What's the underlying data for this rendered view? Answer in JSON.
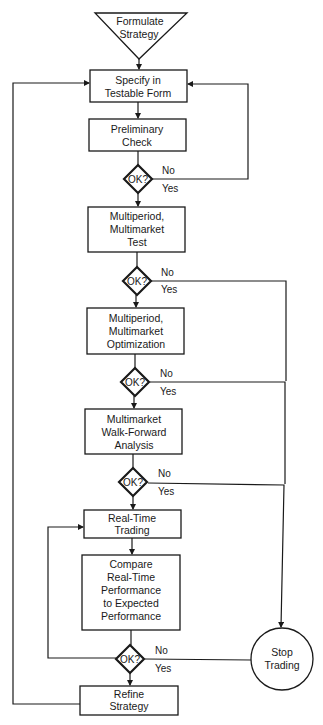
{
  "diagram": {
    "type": "flowchart",
    "colors": {
      "line": "#1a1a1a",
      "background": "#ffffff"
    },
    "nodes": {
      "formulate": {
        "shape": "triangle",
        "lines": [
          "Formulate",
          "Strategy"
        ]
      },
      "specify": {
        "shape": "rect",
        "lines": [
          "Specify in",
          "Testable Form"
        ]
      },
      "preliminary": {
        "shape": "rect",
        "lines": [
          "Preliminary",
          "Check"
        ]
      },
      "ok1": {
        "shape": "diamond",
        "label": "OK?",
        "no": "No",
        "yes": "Yes"
      },
      "test": {
        "shape": "rect",
        "lines": [
          "Multiperiod,",
          "Multimarket",
          "Test"
        ]
      },
      "ok2": {
        "shape": "diamond",
        "label": "OK?",
        "no": "No",
        "yes": "Yes"
      },
      "optimization": {
        "shape": "rect",
        "lines": [
          "Multiperiod,",
          "Multimarket",
          "Optimization"
        ]
      },
      "ok3": {
        "shape": "diamond",
        "label": "OK?",
        "no": "No",
        "yes": "Yes"
      },
      "walkforward": {
        "shape": "rect",
        "lines": [
          "Multimarket",
          "Walk-Forward",
          "Analysis"
        ]
      },
      "ok4": {
        "shape": "diamond",
        "label": "OK?",
        "no": "No",
        "yes": "Yes"
      },
      "realtime": {
        "shape": "rect",
        "lines": [
          "Real-Time",
          "Trading"
        ]
      },
      "compare": {
        "shape": "rect",
        "lines": [
          "Compare",
          "Real-Time",
          "Performance",
          "to Expected",
          "Performance"
        ]
      },
      "ok5": {
        "shape": "diamond",
        "label": "OK?",
        "no": "No",
        "yes": "Yes"
      },
      "stop": {
        "shape": "circle",
        "lines": [
          "Stop",
          "Trading"
        ]
      },
      "refine": {
        "shape": "rect",
        "lines": [
          "Refine",
          "Strategy"
        ]
      }
    },
    "edges": [
      {
        "from": "formulate",
        "to": "specify"
      },
      {
        "from": "specify",
        "to": "preliminary"
      },
      {
        "from": "preliminary",
        "to": "ok1"
      },
      {
        "from": "ok1",
        "to": "test",
        "label": "Yes"
      },
      {
        "from": "ok1",
        "to": "specify",
        "label": "No"
      },
      {
        "from": "test",
        "to": "ok2"
      },
      {
        "from": "ok2",
        "to": "optimization",
        "label": "Yes"
      },
      {
        "from": "ok2",
        "to": "stop",
        "label": "No"
      },
      {
        "from": "optimization",
        "to": "ok3"
      },
      {
        "from": "ok3",
        "to": "walkforward",
        "label": "Yes"
      },
      {
        "from": "ok3",
        "to": "stop",
        "label": "No"
      },
      {
        "from": "walkforward",
        "to": "ok4"
      },
      {
        "from": "ok4",
        "to": "realtime",
        "label": "Yes"
      },
      {
        "from": "ok4",
        "to": "stop",
        "label": "No"
      },
      {
        "from": "realtime",
        "to": "compare"
      },
      {
        "from": "compare",
        "to": "ok5"
      },
      {
        "from": "ok5",
        "to": "realtime",
        "label": "OK loop"
      },
      {
        "from": "ok5",
        "to": "stop",
        "label": "No"
      },
      {
        "from": "ok5",
        "to": "refine",
        "label": "Yes"
      },
      {
        "from": "refine",
        "to": "specify"
      }
    ]
  }
}
